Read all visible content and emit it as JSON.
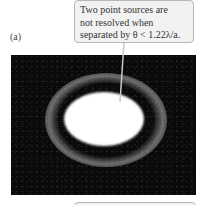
{
  "panel": {
    "label": "(a)"
  },
  "callout": {
    "lines": [
      "Two point sources are",
      "not resolved when",
      "separated by θ < 1.22λ/a."
    ]
  },
  "figure": {
    "background_color": "#0a0a0a",
    "blob_color": "#ffffff",
    "ring_color": "#bebebe"
  },
  "colors": {
    "callout_bg": "#f2f2f2",
    "callout_border": "#b8b8b8",
    "text": "#333333"
  }
}
